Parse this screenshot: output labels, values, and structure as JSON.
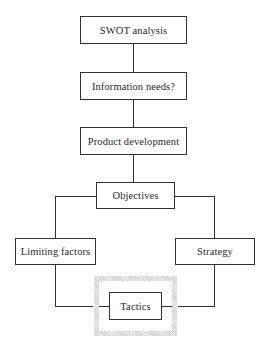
{
  "diagram": {
    "type": "flowchart",
    "nodes": {
      "swot": {
        "label": "SWOT analysis"
      },
      "info": {
        "label": "Information needs?"
      },
      "product": {
        "label": "Product development"
      },
      "objectives": {
        "label": "Objectives"
      },
      "limiting": {
        "label": "Limiting factors"
      },
      "strategy": {
        "label": "Strategy"
      },
      "tactics": {
        "label": "Tactics",
        "highlighted": true
      }
    },
    "edges": [
      {
        "from": "swot",
        "to": "info"
      },
      {
        "from": "info",
        "to": "product"
      },
      {
        "from": "product",
        "to": "objectives"
      },
      {
        "from": "objectives",
        "to": "limiting"
      },
      {
        "from": "objectives",
        "to": "strategy"
      },
      {
        "from": "limiting",
        "to": "tactics"
      },
      {
        "from": "strategy",
        "to": "tactics"
      }
    ],
    "colors": {
      "stroke": "#333333",
      "highlight_frame": "#d9d9d9",
      "background": "#ffffff"
    }
  }
}
